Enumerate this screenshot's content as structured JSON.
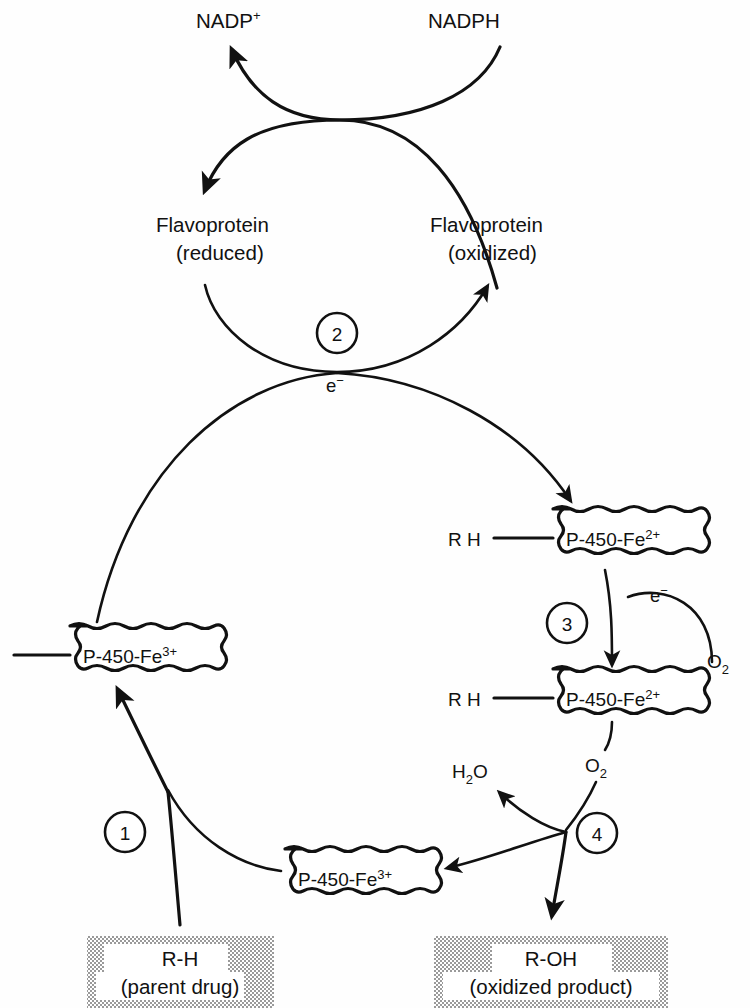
{
  "figure": {
    "background": "#fefefe",
    "ink": "#111111",
    "shade_color": "#b8b8b8"
  },
  "cofactors": {
    "nadp_oxidized": "NADP",
    "nadp_oxidized_charge": "+",
    "nadph": "NADPH",
    "flavoprotein_reduced_line1": "Flavoprotein",
    "flavoprotein_reduced_line2": "(reduced)",
    "flavoprotein_oxidized_line1": "Flavoprotein",
    "flavoprotein_oxidized_line2": "(oxidized)"
  },
  "electrons": {
    "e_cycle": "e",
    "e_cycle_charge": "−",
    "e_step3": "e",
    "e_step3_charge": "−"
  },
  "species": {
    "oxygen": "O",
    "oxygen_sub": "2",
    "oxygen_bound": "O",
    "oxygen_bound_sub": "2",
    "water": "H",
    "water_sub": "2",
    "water_tail": "O"
  },
  "complexes": [
    {
      "id": "complex-fe2-top",
      "substrate": "R H",
      "has_substrate": true,
      "label": "P-450-Fe",
      "charge": "2+"
    },
    {
      "id": "complex-fe2-oxy",
      "substrate": "R H",
      "has_substrate": true,
      "label": "P-450-Fe",
      "charge": "2+"
    },
    {
      "id": "complex-fe3-left",
      "substrate": "R H",
      "has_substrate": true,
      "label": "P-450-Fe",
      "charge": "3+"
    },
    {
      "id": "complex-fe3-bottom",
      "substrate": "",
      "has_substrate": false,
      "label": "P-450-Fe",
      "charge": "3+"
    }
  ],
  "steps": [
    {
      "number": "1",
      "name": "substrate-binding"
    },
    {
      "number": "2",
      "name": "first-electron-transfer"
    },
    {
      "number": "3",
      "name": "oxygen-binding"
    },
    {
      "number": "4",
      "name": "product-release"
    }
  ],
  "terminals": [
    {
      "id": "substrate-box",
      "line1": "R-H",
      "line2": "(parent drug)"
    },
    {
      "id": "product-box",
      "line1": "R-OH",
      "line2": "(oxidized product)"
    }
  ]
}
